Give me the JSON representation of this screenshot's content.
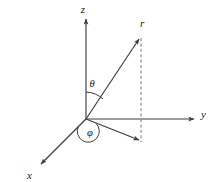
{
  "figure": {
    "background_color": "#ffffff",
    "line_color": "#3d3d3d",
    "label_color": "#1a1a1a",
    "width": 210,
    "height": 182
  },
  "axes": [
    {
      "id": "z",
      "label": "z",
      "description": "vertical axis pointing up",
      "origin": [
        86,
        119
      ],
      "tip": [
        86,
        17
      ],
      "label_pos": [
        83,
        12
      ],
      "style": "solid",
      "arrow": true
    },
    {
      "id": "y",
      "label": "y",
      "description": "horizontal axis pointing right",
      "origin": [
        86,
        119
      ],
      "tip": [
        196,
        119
      ],
      "label_pos": [
        200,
        116
      ],
      "style": "solid",
      "arrow": true
    },
    {
      "id": "x",
      "label": "x",
      "description": "oblique axis pointing lower-left toward viewer",
      "origin": [
        86,
        119
      ],
      "tip": [
        39,
        166
      ],
      "label_pos": [
        27,
        178
      ],
      "style": "solid",
      "arrow": true
    }
  ],
  "vectors": [
    {
      "id": "r",
      "label": "r",
      "description": "radial position vector from origin to point",
      "from": [
        86,
        119
      ],
      "to": [
        140,
        37
      ],
      "label_pos": [
        141,
        26
      ],
      "style": "solid",
      "arrow": true
    },
    {
      "id": "projection",
      "label": "",
      "description": "projection of r onto the xy-plane",
      "from": [
        86,
        119
      ],
      "to": [
        141,
        142
      ],
      "label_pos": null,
      "style": "solid",
      "arrow": true
    }
  ],
  "construction_lines": [
    {
      "id": "vertical-dashed",
      "description": "dashed vertical drop line from tip of r to its xy-plane projection",
      "from": [
        141,
        38
      ],
      "to": [
        141,
        142
      ],
      "style": "dashed",
      "arrow": false
    }
  ],
  "angles": [
    {
      "id": "theta",
      "label": "θ",
      "description": "polar angle measured from the z-axis down to r",
      "label_pos": [
        89,
        86
      ],
      "arc_center": [
        86,
        119
      ],
      "arc_radius": 27,
      "from_deg": 90,
      "to_deg": 56
    },
    {
      "id": "phi",
      "label": "φ",
      "description": "azimuthal angle measured in the xy-plane from the x-axis to the projection of r",
      "label_pos": [
        88,
        135
      ],
      "arc_center": [
        86,
        119
      ],
      "arc_radius": 11,
      "from_deg": 225,
      "to_deg": 337
    }
  ]
}
